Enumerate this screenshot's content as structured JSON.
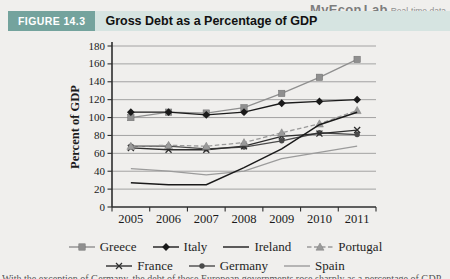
{
  "logo": {
    "brand_left": "MyEcon",
    "brand_right": "Lab",
    "tagline": "Real-time data"
  },
  "header": {
    "figure_label": "FIGURE 14.3",
    "title": "Gross Debt as a Percentage of GDP"
  },
  "caption_partial": "With the exception of Germany, the debt of these European governments rose sharply as a percentage of GDP after 2007.",
  "colors": {
    "header_bar": "#d6e4e1",
    "figure_label_bg": "#74a39d",
    "background": "#f0efed",
    "grid": "#8f8f8f",
    "axis": "#2e2e2e"
  },
  "chart_data": {
    "type": "line",
    "title": "Gross Debt as a Percentage of GDP",
    "xlabel": "",
    "ylabel": "Percent of GDP",
    "ylim": [
      0,
      180
    ],
    "ytick_step": 20,
    "grid": true,
    "legend_position": "bottom",
    "categories": [
      "2005",
      "2006",
      "2007",
      "2008",
      "2009",
      "2010",
      "2011"
    ],
    "series": [
      {
        "name": "Greece",
        "values": [
          100,
          106,
          105,
          111,
          127,
          145,
          165
        ],
        "color": "#8f8f8f",
        "marker": "square",
        "dash": "",
        "legend_row": 0
      },
      {
        "name": "Italy",
        "values": [
          106,
          106,
          103,
          106,
          116,
          118,
          120
        ],
        "color": "#1a1a1a",
        "marker": "diamond",
        "dash": "",
        "legend_row": 0
      },
      {
        "name": "Ireland",
        "values": [
          27,
          25,
          25,
          44,
          65,
          92,
          106
        ],
        "color": "#1a1a1a",
        "marker": "none",
        "dash": "",
        "legend_row": 0
      },
      {
        "name": "Portugal",
        "values": [
          68,
          69,
          68,
          72,
          83,
          93,
          108
        ],
        "color": "#9a9a9a",
        "marker": "triangle",
        "dash": "4.5,2.5",
        "legend_row": 0
      },
      {
        "name": "France",
        "values": [
          66,
          64,
          64,
          68,
          79,
          82,
          86
        ],
        "color": "#2e2e2e",
        "marker": "x",
        "dash": "",
        "legend_row": 1
      },
      {
        "name": "Germany",
        "values": [
          68,
          68,
          65,
          67,
          74,
          83,
          81
        ],
        "color": "#4a4a4a",
        "marker": "circle",
        "dash": "",
        "legend_row": 1
      },
      {
        "name": "Spain",
        "values": [
          43,
          40,
          36,
          40,
          54,
          61,
          68
        ],
        "color": "#9b9b9b",
        "marker": "none",
        "dash": "",
        "legend_row": 1
      }
    ]
  }
}
